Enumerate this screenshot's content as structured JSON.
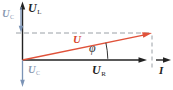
{
  "colors": {
    "axis": "#222222",
    "phasor": "#e0523a",
    "phasor_label": "#d8452c",
    "reactive_blue": "#7b93b5",
    "reactive_blue_label": "#8a9ab2",
    "dash": "#9aa0a6",
    "arc": "#333333",
    "background": "#ffffff"
  },
  "labels": {
    "u_l": {
      "symbol": "U",
      "sub": "L"
    },
    "u_c_top": {
      "symbol": "U",
      "sub": "C"
    },
    "u_c_bottom": {
      "symbol": "U",
      "sub": "C"
    },
    "u_r": {
      "symbol": "U",
      "sub": "R"
    },
    "u_phasor": {
      "symbol": "U"
    },
    "current": {
      "symbol": "I"
    },
    "phase_angle": {
      "symbol": "φ"
    }
  }
}
